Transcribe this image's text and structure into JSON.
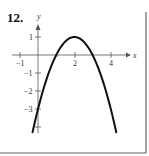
{
  "problem": {
    "number": "12."
  },
  "chart_data": {
    "type": "line",
    "title": "",
    "xlabel": "x",
    "ylabel": "y",
    "function": "y = -(x - 2)^2 + 1",
    "x_ticks": [
      -1,
      2,
      4
    ],
    "x_tick_labels": [
      "−1",
      "2",
      "4"
    ],
    "y_ticks": [
      1,
      -1,
      -2,
      -3,
      -4
    ],
    "y_tick_labels": [
      "1",
      "−1",
      "−2",
      "−3",
      ""
    ],
    "xlim": [
      -1.2,
      4.8
    ],
    "ylim": [
      -4.5,
      2.0
    ],
    "grid": false,
    "series": [
      {
        "name": "parabola",
        "x": [
          -0.3,
          0,
          0.5,
          1,
          1.5,
          2,
          2.5,
          3,
          3.5,
          4,
          4.3
        ],
        "y": [
          -4.29,
          -3,
          -1.25,
          0,
          0.75,
          1,
          0.75,
          0,
          -1.25,
          -3,
          -4.29
        ]
      }
    ],
    "vertex": [
      2,
      1
    ],
    "x_intercepts": [
      1,
      3
    ],
    "y_intercept": -3
  },
  "colors": {
    "curve": "#111111",
    "axis": "#555555",
    "frame": "#666666"
  }
}
